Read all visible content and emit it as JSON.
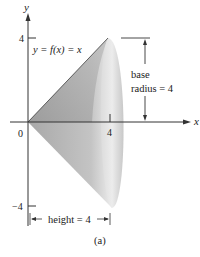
{
  "figure": {
    "caption": "(a)",
    "axes": {
      "x_label": "x",
      "y_label": "y",
      "origin_label": "0",
      "y_tick_top": "4",
      "y_tick_bottom": "−4",
      "x_tick": "4"
    },
    "curve_label": "y = f(x) = x",
    "base_label_line1": "base",
    "base_label_line2": "radius = 4",
    "height_label": "height = 4",
    "colors": {
      "cone_dark": "#a9a9a9",
      "cone_light": "#e6e6e6",
      "axis": "#333333"
    }
  }
}
